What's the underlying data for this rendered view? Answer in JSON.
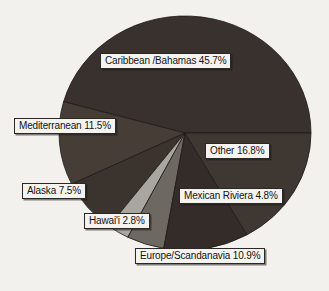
{
  "chart_data": {
    "type": "pie",
    "title": "",
    "subtitle": "",
    "xlabel": "",
    "ylabel": "",
    "legend_position": "none",
    "grid": false,
    "labels_style": "boxed-callout",
    "unit": "percent",
    "categories": [
      "Caribbean /Bahamas",
      "Other",
      "Mexican Riviera",
      "Europe/Scandanavia",
      "Hawai'i",
      "Alaska",
      "Mediterranean"
    ],
    "values": [
      45.7,
      16.8,
      4.8,
      10.9,
      2.8,
      7.5,
      11.5
    ],
    "slices": [
      {
        "name": "Caribbean /Bahamas",
        "value": 45.7,
        "label": "Caribbean /Bahamas 45.7%",
        "color": "#38312d",
        "start_angle": 0.0,
        "end_angle": 164.5
      },
      {
        "name": "Mediterranean",
        "value": 11.5,
        "label": "Mediterranean 11.5%",
        "color": "#463d37",
        "start_angle": 164.5,
        "end_angle": 205.9
      },
      {
        "name": "Alaska",
        "value": 7.5,
        "label": "Alaska 7.5%",
        "color": "#3b332e",
        "start_angle": 205.9,
        "end_angle": 232.9
      },
      {
        "name": "Hawai'i",
        "value": 2.8,
        "label": "Hawai'i 2.8%",
        "color": "#a9a6a1",
        "start_angle": 232.9,
        "end_angle": 243.0
      },
      {
        "name": "Mexican Riviera",
        "value": 4.8,
        "label": "Mexican Riviera 4.8%",
        "color": "#6e6862",
        "start_angle": 243.0,
        "end_angle": 260.3
      },
      {
        "name": "Europe/Scandanavia",
        "value": 10.9,
        "label": "Europe/Scandanavia 10.9%",
        "color": "#332c28",
        "start_angle": 260.3,
        "end_angle": 299.5
      },
      {
        "name": "Other",
        "value": 16.8,
        "label": "Other 16.8%",
        "color": "#3e3732",
        "start_angle": 299.5,
        "end_angle": 360.0
      }
    ]
  },
  "labels": {
    "caribbean": "Caribbean /Bahamas 45.7%",
    "mediterranean": "Mediterranean 11.5%",
    "other": "Other 16.8%",
    "alaska": "Alaska 7.5%",
    "mexican_riviera": "Mexican Riviera 4.8%",
    "hawaii": "Hawai'i 2.8%",
    "europe": "Europe/Scandanavia 10.9%"
  },
  "colors": {
    "background": "#f2f1ee",
    "label_box_fill": "#f4f3f0",
    "label_box_border": "#2a2724",
    "text": "#151312",
    "slice_dark": "#38312d",
    "slice_mid_gray": "#6e6862",
    "slice_light_gray": "#a9a6a1"
  }
}
